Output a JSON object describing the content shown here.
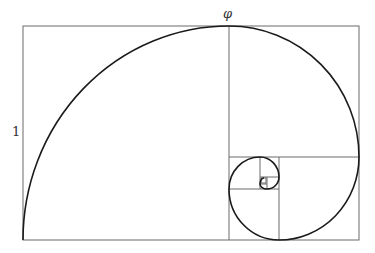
{
  "diagram": {
    "labels": {
      "top": "φ",
      "left": "1"
    },
    "colors": {
      "grid": "#6b6b6b",
      "spiral": "#1a1a1a",
      "background": "#ffffff"
    }
  }
}
